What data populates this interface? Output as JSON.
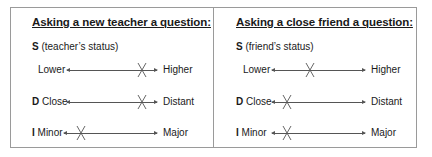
{
  "panels": [
    {
      "title": "Asking a new teacher a question:",
      "s_letter": "S",
      "s_desc": "(teacher’s status)",
      "scales": [
        {
          "letter": "",
          "left": "Lower",
          "right": "Higher",
          "mark_position": 0.8
        },
        {
          "letter": "D",
          "left": "Close",
          "right": "Distant",
          "mark_position": 0.8
        },
        {
          "letter": "I",
          "left": "Minor",
          "right": "Major",
          "mark_position": 0.2
        }
      ]
    },
    {
      "title": "Asking a close friend a question:",
      "s_letter": "S",
      "s_desc": "(friend’s status)",
      "scales": [
        {
          "letter": "",
          "left": "Lower",
          "right": "Higher",
          "mark_position": 0.4
        },
        {
          "letter": "D",
          "left": "Close",
          "right": "Distant",
          "mark_position": 0.15
        },
        {
          "letter": "I",
          "left": "Minor",
          "right": "Major",
          "mark_position": 0.15
        }
      ]
    }
  ],
  "colors": {
    "border": "#9a9a9a",
    "axis": "#555555",
    "text": "#1a1a1a"
  }
}
